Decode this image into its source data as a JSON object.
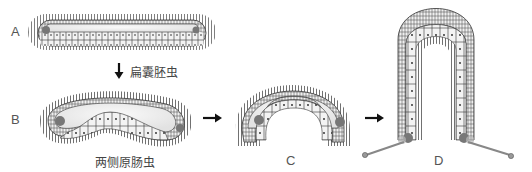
{
  "figure": {
    "stages": [
      {
        "id": "A",
        "label": "A",
        "shape": "elongated flat larva"
      },
      {
        "id": "B",
        "label": "B",
        "shape": "curved larva",
        "caption": "两侧原肠虫"
      },
      {
        "id": "C",
        "label": "C",
        "shape": "arched larva"
      },
      {
        "id": "D",
        "label": "D",
        "shape": "inverted U larva with stalks"
      }
    ],
    "arrow_A_B_caption": "扁囊胚虫",
    "colors": {
      "cilia": "#333333",
      "cell_fill": "#f2f2f2",
      "cell_line": "#333333",
      "cavity": "#e6e6e6",
      "pigment": "#777777",
      "stalk": "#888888",
      "arrow": "#111111"
    }
  }
}
